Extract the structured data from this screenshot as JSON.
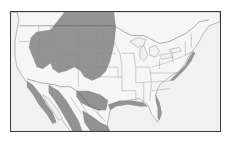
{
  "map": {
    "region": "North America (conterminous United States and Mexico)",
    "type": "species range map",
    "colors": {
      "range_fill": "#8d8d8d",
      "land": "#f6f6f6",
      "ocean": "#f1f1f1",
      "frame": "#3a3a3a",
      "borders": "#4a4a4a"
    },
    "legend": [],
    "labels": []
  }
}
